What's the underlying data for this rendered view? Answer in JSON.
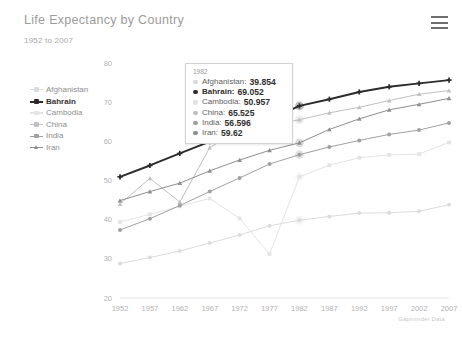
{
  "header": {
    "title": "Life Expectancy by Country",
    "subtitle": "1952 to 2007",
    "menu_icon": "hamburger-menu-icon"
  },
  "credit": "Gapminder Data",
  "tooltip": {
    "year": "1982",
    "rows": [
      {
        "name": "Afghanistan:",
        "value": "39.854",
        "bold": false,
        "color": "#d8d8d8"
      },
      {
        "name": "Bahrain:",
        "value": "69.052",
        "bold": true,
        "color": "#2b2b2b"
      },
      {
        "name": "Cambodia:",
        "value": "50.957",
        "bold": false,
        "color": "#e2e2e2"
      },
      {
        "name": "China:",
        "value": "65.525",
        "bold": false,
        "color": "#bdbdbd"
      },
      {
        "name": "India:",
        "value": "56.596",
        "bold": false,
        "color": "#9e9e9e"
      },
      {
        "name": "Iran:",
        "value": "59.62",
        "bold": false,
        "color": "#8c8c8c"
      }
    ]
  },
  "legend": {
    "items": [
      {
        "label": "Afghanistan",
        "color": "#dcdcdc",
        "bold": false,
        "marker": "plus"
      },
      {
        "label": "Bahrain",
        "color": "#2b2b2b",
        "bold": true,
        "marker": "plus"
      },
      {
        "label": "Cambodia",
        "color": "#e4e4e4",
        "bold": false,
        "marker": "square"
      },
      {
        "label": "China",
        "color": "#c0c0c0",
        "bold": false,
        "marker": "plus"
      },
      {
        "label": "India",
        "color": "#a0a0a0",
        "bold": false,
        "marker": "plus"
      },
      {
        "label": "Iran",
        "color": "#8e8e8e",
        "bold": false,
        "marker": "triangle"
      }
    ]
  },
  "chart_data": {
    "type": "line",
    "title": "Life Expectancy by Country",
    "subtitle": "1952 to 2007",
    "xlabel": "",
    "ylabel": "",
    "x": [
      1952,
      1957,
      1962,
      1967,
      1972,
      1977,
      1982,
      1987,
      1992,
      1997,
      2002,
      2007
    ],
    "xticks": [
      "1952",
      "1957",
      "1962",
      "1967",
      "1972",
      "1977",
      "1982",
      "1987",
      "1992",
      "1997",
      "2002",
      "2007"
    ],
    "yticks": [
      80,
      70,
      60,
      50,
      40,
      30,
      20
    ],
    "ylim": [
      20,
      80
    ],
    "xlim": [
      1952,
      2007
    ],
    "grid": false,
    "legend_position": "left",
    "highlight_year": 1982,
    "series": [
      {
        "name": "Afghanistan",
        "color": "#dcdcdc",
        "marker": "circle",
        "values": [
          28.801,
          30.332,
          31.997,
          34.02,
          36.088,
          38.438,
          39.854,
          40.822,
          41.674,
          41.763,
          42.129,
          43.828
        ]
      },
      {
        "name": "Bahrain",
        "color": "#2b2b2b",
        "marker": "plus",
        "values": [
          50.939,
          53.832,
          56.923,
          59.923,
          63.3,
          65.593,
          69.052,
          70.75,
          72.601,
          73.925,
          74.795,
          75.635
        ]
      },
      {
        "name": "Cambodia",
        "color": "#e4e4e4",
        "marker": "square",
        "values": [
          39.417,
          41.366,
          43.415,
          45.415,
          40.317,
          31.22,
          50.957,
          53.914,
          55.803,
          56.534,
          56.752,
          59.723
        ]
      },
      {
        "name": "China",
        "color": "#c0c0c0",
        "marker": "triangle",
        "values": [
          44.0,
          50.54896,
          44.50136,
          58.38112,
          63.11888,
          63.96736,
          65.525,
          67.274,
          68.69,
          70.426,
          72.028,
          72.961
        ]
      },
      {
        "name": "India",
        "color": "#a0a0a0",
        "marker": "circle",
        "values": [
          37.373,
          40.249,
          43.605,
          47.193,
          50.651,
          54.208,
          56.596,
          58.553,
          60.223,
          61.765,
          62.879,
          64.698
        ]
      },
      {
        "name": "Iran",
        "color": "#8e8e8e",
        "marker": "triangle",
        "values": [
          44.869,
          47.181,
          49.325,
          52.469,
          55.234,
          57.702,
          59.62,
          63.04,
          65.742,
          68.042,
          69.451,
          70.964
        ]
      }
    ]
  }
}
